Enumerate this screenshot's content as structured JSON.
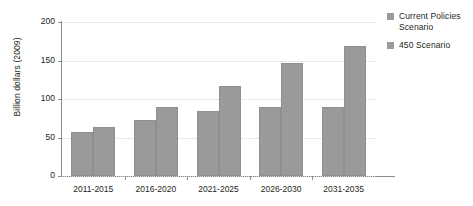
{
  "chart_data": {
    "type": "bar",
    "title": "",
    "xlabel": "",
    "ylabel": "Billion dollars (2009)",
    "ylim": [
      0,
      200
    ],
    "yticks": [
      0,
      50,
      100,
      150,
      200
    ],
    "ytick_labels": [
      "0",
      "50",
      "100",
      "150",
      "200"
    ],
    "grid": true,
    "legend_position": "right",
    "categories": [
      "2011-2015",
      "2016-2020",
      "2021-2025",
      "2026-2030",
      "2031-2035"
    ],
    "series": [
      {
        "name": "Current Policies Scenario",
        "color": "#9a9a9a",
        "values": [
          57,
          73,
          84,
          90,
          90
        ]
      },
      {
        "name": "450 Scenario",
        "color": "#9a9a9a",
        "values": [
          64,
          90,
          117,
          147,
          169
        ]
      }
    ]
  },
  "legend": {
    "entries": [
      {
        "label_line1": "Current Policies",
        "label_line2": "Scenario"
      },
      {
        "label_line1": "450 Scenario",
        "label_line2": ""
      }
    ]
  },
  "axes": {
    "y_title": "Billion dollars (2009)"
  },
  "title_remnant": ""
}
